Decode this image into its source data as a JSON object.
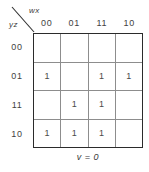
{
  "figure": {
    "kind": "karnaugh-map",
    "caption": "v = 0",
    "column_variable_label": "wx",
    "row_variable_label": "yz",
    "column_headers": [
      "00",
      "01",
      "11",
      "10"
    ],
    "row_headers": [
      "00",
      "01",
      "11",
      "10"
    ],
    "cells": [
      [
        "",
        "",
        "",
        ""
      ],
      [
        "1",
        "",
        "1",
        "1"
      ],
      [
        "",
        "1",
        "1",
        ""
      ],
      [
        "1",
        "1",
        "1",
        ""
      ]
    ],
    "colors": {
      "background": "#ffffff",
      "border": "#2b2b2b",
      "gridline": "#8d8d8d",
      "text": "#3a3a3a"
    }
  }
}
